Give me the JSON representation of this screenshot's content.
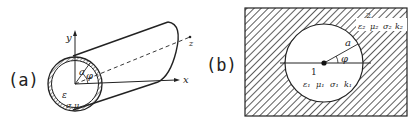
{
  "figure": {
    "panels": [
      {
        "id": "a",
        "label": "(a)",
        "description": "Hollow conducting cylindrical shell with coordinate axes",
        "axes": {
          "x": "x",
          "y": "y",
          "z": "z"
        },
        "radius_label": "a",
        "angle_label": "φ",
        "interior_label": "ε",
        "shell_label": "σ,μ"
      },
      {
        "id": "b",
        "label": "(b)",
        "description": "Cross-section: circular region 1 embedded in hatched region 2",
        "radius_label": "a",
        "angle_label": "φ",
        "region1": {
          "number": "1",
          "params": [
            "ε₁",
            "μ₁",
            "σ₁",
            "k₁"
          ]
        },
        "region2": {
          "number": "2",
          "params": [
            "ε₂",
            "μ₂",
            "σ₂",
            "k₂"
          ]
        }
      }
    ],
    "colors": {
      "ink": "#222222",
      "background": "#ffffff"
    }
  }
}
